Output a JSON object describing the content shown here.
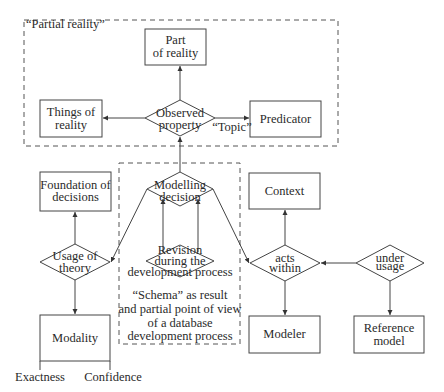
{
  "diagram": {
    "groups": {
      "partial_reality": "“Partial reality”",
      "schema_lines": [
        "“Schema” as result",
        "and partial point of view",
        "of a database",
        "development process"
      ]
    },
    "entities": {
      "part_of_reality": [
        "Part",
        "of reality"
      ],
      "things_of_reality": [
        "Things of",
        "reality"
      ],
      "predicator": [
        "Predicator"
      ],
      "foundation_of_decisions": [
        "Foundation of",
        "decisions"
      ],
      "modality": [
        "Modality"
      ],
      "context": [
        "Context"
      ],
      "modeler": [
        "Modeler"
      ],
      "reference_model": [
        "Reference",
        "model"
      ]
    },
    "relationships": {
      "observed_property": [
        "Observed",
        "property"
      ],
      "modelling_decision": [
        "Modelling",
        "decision"
      ],
      "usage_of_theory": [
        "Usage of",
        "theory"
      ],
      "revision": [
        "Revision",
        "during the",
        "development process"
      ],
      "acts_within": [
        "acts",
        "within"
      ],
      "under_usage": [
        "under",
        "usage"
      ]
    },
    "edge_labels": {
      "topic": "“Topic”"
    },
    "modality_attributes": [
      "Exactness",
      "Confidence"
    ],
    "colors": {
      "stroke": "#444444",
      "text": "#2a2a2a",
      "background": "#ffffff"
    }
  }
}
